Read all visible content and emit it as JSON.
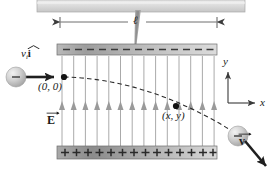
{
  "figure": {
    "background_color": "#ffffff"
  },
  "colors": {
    "plate_fill_dark": "#8d8d8d",
    "plate_fill_light": "#c9c9c9",
    "plate_stroke": "#5a5a5a",
    "field_line": "#9a9a9a",
    "field_arrow": "#9a9a9a",
    "trajectory": "#2b2b2b",
    "vector_arrow": "#1f1f1f",
    "particle_fill": "#cfcfcf",
    "particle_edge": "#8a8a8a",
    "dimension_line": "#4a4a4a",
    "axis": "#3a3a3a",
    "top_bar": "#d8d8d8",
    "stem": "#9b9b9b",
    "text": "#1a1a1a"
  },
  "top_bar": {
    "name": "mounting-bar",
    "x": 37,
    "y": 0,
    "width": 208,
    "height": 12
  },
  "stem": {
    "name": "support-stem",
    "top_x": 138,
    "top_y": 10,
    "bottom_x": 134,
    "bottom_y": 52
  },
  "dimension": {
    "label": "ℓ",
    "label_description": "plate length ell",
    "line_y": 22,
    "x_start": 60,
    "x_end": 217,
    "tick_height": 9
  },
  "plates": {
    "negative": {
      "name": "negative-plate",
      "sign": "−",
      "count": 13,
      "x": 57,
      "y": 44,
      "width": 160,
      "height": 11
    },
    "positive": {
      "name": "positive-plate",
      "sign": "+",
      "count": 14,
      "x": 57,
      "y": 146,
      "width": 160,
      "height": 13
    }
  },
  "field": {
    "label": "E",
    "label_description": "electric field vector E",
    "label_x": 48,
    "label_y": 118,
    "line_count": 14,
    "x_start": 62,
    "x_spacing": 11.7,
    "y_top": 56,
    "y_bottom": 146,
    "arrow_y": 108,
    "direction": "up"
  },
  "trajectory": {
    "name": "parabolic-path",
    "style": "dashed",
    "start": {
      "x": 64,
      "y": 77
    },
    "end": {
      "x": 240,
      "y": 136
    },
    "description": "parabolic deflection downward"
  },
  "points": [
    {
      "name": "origin-point",
      "label": "(0, 0)",
      "dot_x": 64,
      "dot_y": 77,
      "label_x": 40,
      "label_y": 82
    },
    {
      "name": "field-point",
      "label": "(x, y)",
      "dot_x": 176,
      "dot_y": 106,
      "label_x": 163,
      "label_y": 112
    }
  ],
  "particles": [
    {
      "name": "incoming-electron",
      "charge_sign": "−",
      "cx": 16,
      "cy": 77,
      "r": 10
    },
    {
      "name": "exiting-electron",
      "charge_sign": "−",
      "cx": 238,
      "cy": 136,
      "r": 10
    }
  ],
  "vectors": {
    "initial_velocity": {
      "name": "initial-velocity-vector",
      "label_base": "v",
      "label_sub": "i",
      "label_unit": "i",
      "label_text": "v_i î",
      "label_x": 21,
      "label_y": 54,
      "arrow": {
        "x1": 22,
        "y1": 77,
        "x2": 60,
        "y2": 77
      }
    },
    "final_velocity": {
      "name": "final-velocity-vector",
      "label_base": "v",
      "label_text": "v",
      "label_x": 240,
      "label_y": 142,
      "arrow": {
        "x1": 245,
        "y1": 141,
        "x2": 272,
        "y2": 172
      }
    }
  },
  "axes": {
    "name": "coordinate-axes",
    "origin": {
      "x": 228,
      "y": 103
    },
    "y_label": "y",
    "x_label": "x",
    "y_label_x": 224,
    "y_label_y": 62,
    "x_label_x": 262,
    "x_label_y": 97,
    "y_tip": {
      "x": 228,
      "y": 68
    },
    "x_tip": {
      "x": 259,
      "y": 103
    }
  }
}
